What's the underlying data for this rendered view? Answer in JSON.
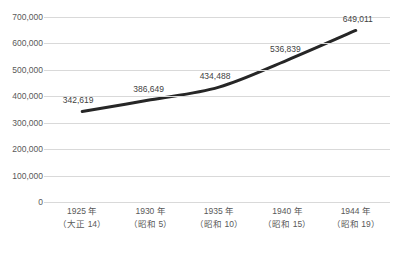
{
  "chart_data": {
    "type": "line",
    "title": "",
    "xlabel": "",
    "ylabel": "",
    "categories": [
      "1925 年",
      "1930 年",
      "1935 年",
      "1940 年",
      "1944 年"
    ],
    "category_sublabels": [
      "（大正 14）",
      "（昭和 5）",
      "（昭和 10）",
      "（昭和 15）",
      "（昭和 19）"
    ],
    "values": [
      342619,
      386649,
      434488,
      536839,
      649011
    ],
    "data_labels": [
      "342,619",
      "386,649",
      "434,488",
      "536,839",
      "649,011"
    ],
    "ylim": [
      0,
      700000
    ],
    "ytick_values": [
      700000,
      600000,
      500000,
      400000,
      300000,
      200000,
      100000,
      0
    ],
    "ytick_labels": [
      "700,000",
      "600,000",
      "500,000",
      "400,000",
      "300,000",
      "200,000",
      "100,000",
      "0"
    ],
    "grid": true,
    "legend": false,
    "smoothed": true,
    "series": [
      {
        "name": "",
        "values": [
          342619,
          386649,
          434488,
          536839,
          649011
        ]
      }
    ],
    "colors": {
      "line": "#262626",
      "gridline": "#d9d9d9",
      "axis_text": "#595959",
      "data_label_text": "#3f3f3f",
      "background": "#ffffff"
    }
  }
}
